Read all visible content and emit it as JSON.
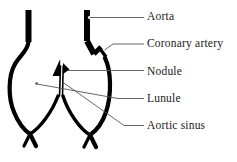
{
  "diagram": {
    "colors": {
      "structure": "#000000",
      "leader_line": "#555555",
      "background": "#ffffff",
      "text": "#1a1a1a"
    },
    "labels": [
      {
        "id": "aorta",
        "text": "Aorta",
        "leader_from_x": 96,
        "leader_from_y": 18,
        "leader_to_x": 144,
        "leader_to_y": 18
      },
      {
        "id": "coronary",
        "text": "Coronary artery",
        "leader_from_x": 104,
        "leader_from_y": 50,
        "leader_to_x": 144,
        "leader_to_y": 44
      },
      {
        "id": "nodule",
        "text": "Nodule",
        "leader_from_x": 64,
        "leader_from_y": 71,
        "leader_to_x": 144,
        "leader_to_y": 71
      },
      {
        "id": "lunule",
        "text": "Lunule",
        "leader_from_x": 37,
        "leader_from_y": 84,
        "leader_to_x": 144,
        "leader_to_y": 99
      },
      {
        "id": "aortic_sinus",
        "text": "Aortic sinus",
        "leader_from_x": 63,
        "leader_from_y": 82,
        "leader_to_x": 144,
        "leader_to_y": 126
      }
    ],
    "structures": [
      "left-aortic-wall",
      "right-aortic-wall",
      "coronary-artery-branch",
      "left-aortic-sinus",
      "right-aortic-sinus",
      "valve-cusp-nodule",
      "valve-cusp-lunule"
    ]
  }
}
